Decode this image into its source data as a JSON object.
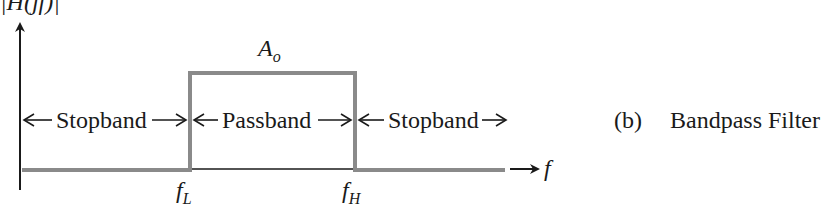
{
  "diagram": {
    "y_axis_label": "|H(jf)|",
    "x_axis_label": "f",
    "amplitude_label": {
      "main": "A",
      "sub": "o"
    },
    "cutoff_low": {
      "main": "f",
      "sub": "L"
    },
    "cutoff_high": {
      "main": "f",
      "sub": "H"
    },
    "regions": [
      {
        "label": "Stopband"
      },
      {
        "label": "Passband"
      },
      {
        "label": "Stopband"
      }
    ],
    "caption": {
      "tag": "(b)",
      "title": "Bandpass Filter"
    },
    "colors": {
      "axis": "#1a1a1a",
      "response": "#8a8a8a"
    }
  }
}
